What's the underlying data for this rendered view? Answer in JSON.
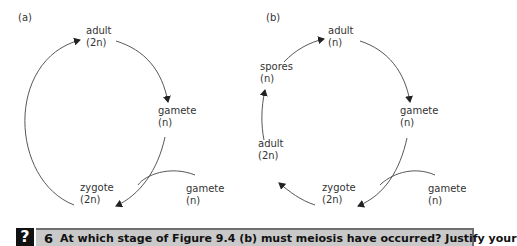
{
  "panel_a": {
    "tag": "(a)",
    "nodes": [
      {
        "name": "adult",
        "ploidy": "(2n)"
      },
      {
        "name": "gamete",
        "ploidy": "(n)"
      },
      {
        "name": "zygote",
        "ploidy": "(2n)"
      },
      {
        "name": "gamete",
        "ploidy": "(n)"
      }
    ]
  },
  "panel_b": {
    "tag": "(b)",
    "nodes": [
      {
        "name": "adult",
        "ploidy": "(n)"
      },
      {
        "name": "gamete",
        "ploidy": "(n)"
      },
      {
        "name": "zygote",
        "ploidy": "(2n)"
      },
      {
        "name": "adult",
        "ploidy": "(2n)"
      },
      {
        "name": "spores",
        "ploidy": "(n)"
      },
      {
        "name": "gamete",
        "ploidy": "(n)"
      }
    ]
  },
  "question": {
    "icon": "?",
    "number": "6",
    "text": "At which stage of Figure 9.4 (b) must meiosis have occurred? Justify your"
  },
  "colors": {
    "line": "#333333",
    "question_bar": "#c9c9c9",
    "question_border": "#6f6f6f",
    "icon_bg": "#111111"
  }
}
